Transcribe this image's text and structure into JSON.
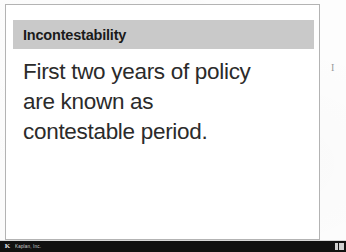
{
  "slide": {
    "title": "Incontestability",
    "body_lines": [
      "First two years of policy",
      "are known as",
      "contestable period."
    ],
    "title_band_color": "#c9c9c9",
    "card_border_color": "#b3b3b3",
    "body_text_color": "#2b2b2b"
  },
  "margin": {
    "stray_mark": "I"
  },
  "app_bar": {
    "logo_glyph": "K",
    "title": "Kaplan, Inc.",
    "background_color": "#111111",
    "text_color": "#d2d2d2"
  }
}
